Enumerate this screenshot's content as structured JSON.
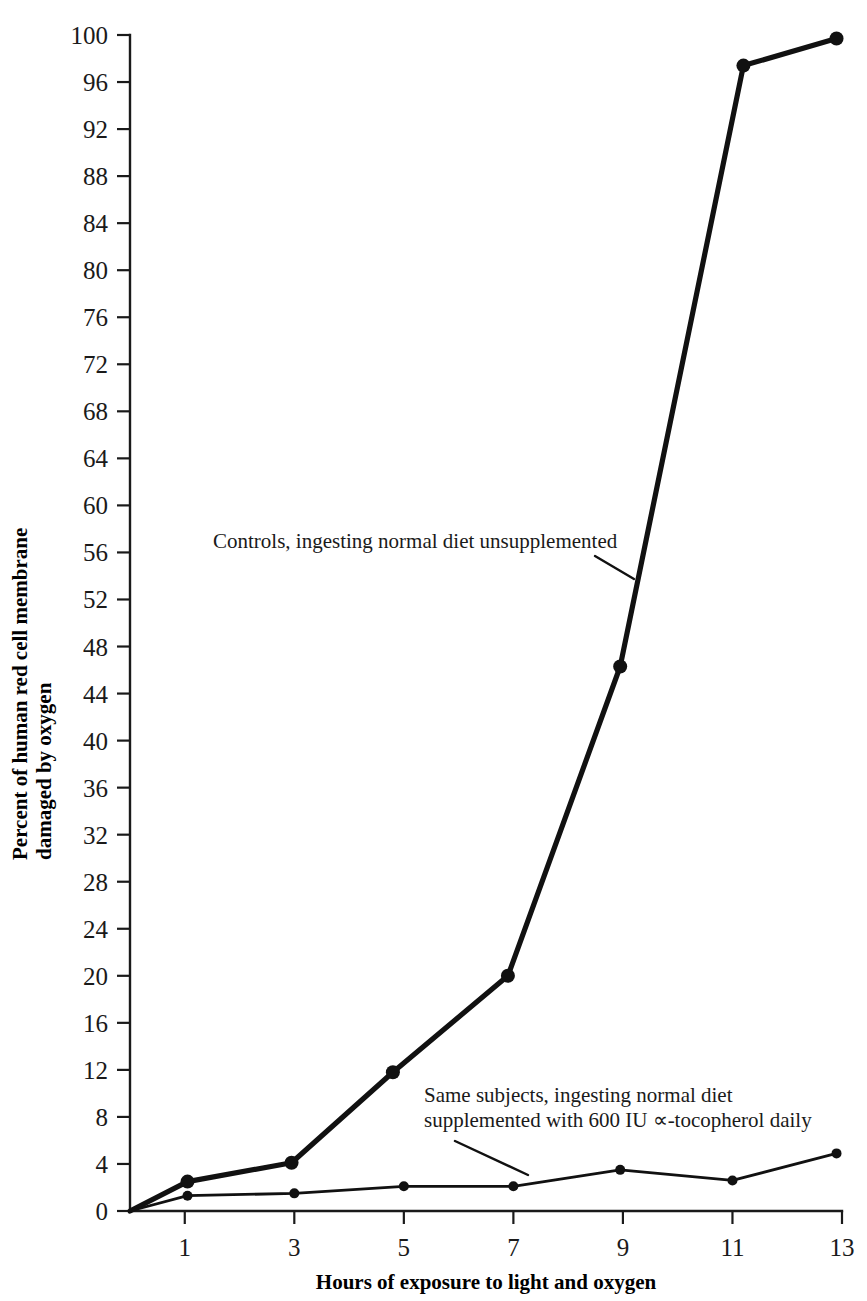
{
  "chart_data": {
    "type": "line",
    "title": "",
    "xlabel": "Hours of exposure to light and oxygen",
    "ylabel_line1": "Percent of human red cell membrane",
    "ylabel_line2": "damaged by oxygen",
    "xlim": [
      0,
      13
    ],
    "ylim": [
      0,
      100
    ],
    "grid": false,
    "legend_position": "inline-annotations",
    "xticks": [
      1,
      3,
      5,
      7,
      9,
      11,
      13
    ],
    "xtick_labels": [
      "1",
      "3",
      "5",
      "7",
      "9",
      "11",
      "13"
    ],
    "yticks": [
      0,
      4,
      8,
      12,
      16,
      20,
      24,
      28,
      32,
      36,
      40,
      44,
      48,
      52,
      56,
      60,
      64,
      68,
      72,
      76,
      80,
      84,
      88,
      92,
      96,
      100
    ],
    "ytick_labels": [
      "0",
      "4",
      "8",
      "12",
      "16",
      "20",
      "24",
      "28",
      "32",
      "36",
      "40",
      "44",
      "48",
      "52",
      "56",
      "60",
      "64",
      "68",
      "72",
      "76",
      "80",
      "84",
      "88",
      "92",
      "96",
      "100"
    ],
    "series": [
      {
        "name": "Controls, ingesting normal diet unsupplemented",
        "annotation": "Controls, ingesting normal diet unsupplemented",
        "style": "thick",
        "points": [
          {
            "x": 0,
            "y": 0
          },
          {
            "x": 1.05,
            "y": 2.5
          },
          {
            "x": 2.95,
            "y": 4.1
          },
          {
            "x": 4.8,
            "y": 11.8
          },
          {
            "x": 6.9,
            "y": 20.0
          },
          {
            "x": 8.95,
            "y": 46.3
          },
          {
            "x": 11.2,
            "y": 97.4
          },
          {
            "x": 12.9,
            "y": 99.7
          }
        ]
      },
      {
        "name": "Same subjects, ingesting normal diet supplemented with 600 IU ∝-tocopherol daily",
        "annotation_line1": "Same subjects, ingesting normal diet",
        "annotation_line2": "supplemented with 600 IU ∝-tocopherol daily",
        "style": "thin",
        "points": [
          {
            "x": 0,
            "y": 0
          },
          {
            "x": 1.05,
            "y": 1.3
          },
          {
            "x": 3.0,
            "y": 1.5
          },
          {
            "x": 5.0,
            "y": 2.1
          },
          {
            "x": 7.0,
            "y": 2.1
          },
          {
            "x": 8.95,
            "y": 3.5
          },
          {
            "x": 11.0,
            "y": 2.6
          },
          {
            "x": 12.9,
            "y": 4.9
          }
        ]
      }
    ],
    "colors": {
      "line": "#111111",
      "text": "#1a1a1a",
      "background": "#ffffff"
    }
  }
}
